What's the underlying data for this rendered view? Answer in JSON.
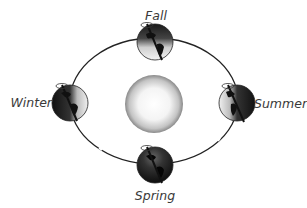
{
  "diagram": {
    "type": "earth-orbit-seasons",
    "sun": {
      "label": "",
      "center": [
        154,
        104
      ],
      "radius": 29
    },
    "orbit": {
      "center": [
        154,
        101
      ],
      "rx": 84,
      "ry": 63,
      "color": "#222222"
    },
    "seasons": [
      {
        "id": "fall",
        "label": "Fall",
        "position": "top",
        "earth_center": [
          155,
          42
        ],
        "lit_side": "bottom"
      },
      {
        "id": "summer",
        "label": "Summer",
        "position": "right",
        "earth_center": [
          237,
          103
        ],
        "lit_side": "left"
      },
      {
        "id": "spring",
        "label": "Spring",
        "position": "bottom",
        "earth_center": [
          155,
          165
        ],
        "lit_side": "top"
      },
      {
        "id": "winter",
        "label": "Winter",
        "position": "left",
        "earth_center": [
          70,
          103
        ],
        "lit_side": "right"
      }
    ],
    "colors": {
      "earth_dark": "#1a1a1a",
      "earth_light": "#e8e8e8",
      "sun_center": "#ffffff",
      "sun_edge": "#8a8a8a",
      "label": "#3a3a3a"
    }
  }
}
